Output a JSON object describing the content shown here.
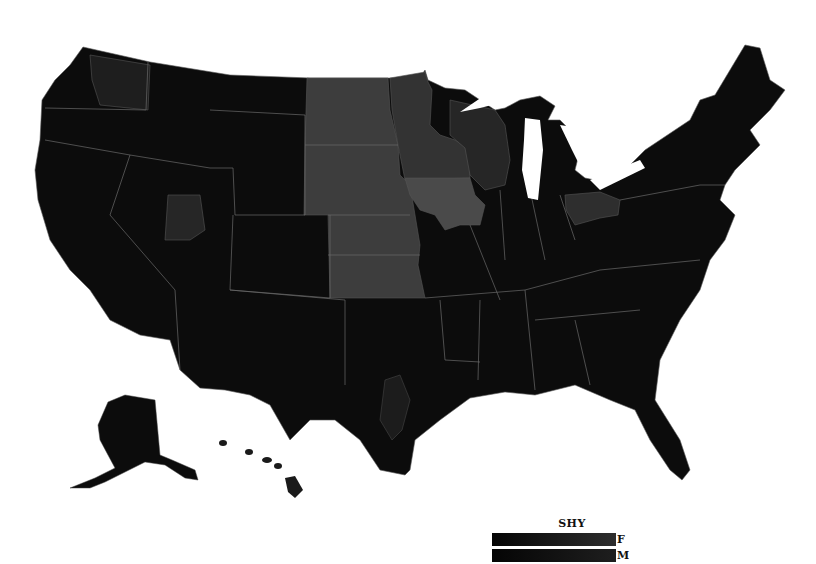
{
  "map": {
    "title": "",
    "region": "United States",
    "colors": {
      "background": "#ffffff",
      "base": "#0b0b0b",
      "dark": "#141414",
      "mid": "#262626",
      "light": "#3d3d3d",
      "lighter": "#4a4a4a",
      "border": "#6a6a6a"
    }
  },
  "legend": {
    "title": "SHY",
    "rows": [
      {
        "label": "F",
        "gradient_start": "#050505",
        "gradient_end": "#2e2e2e"
      },
      {
        "label": "M",
        "gradient_start": "#050505",
        "gradient_end": "#1e1e1e"
      }
    ]
  }
}
